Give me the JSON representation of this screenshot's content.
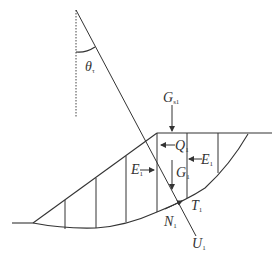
{
  "diagram": {
    "type": "slope-stability-slice-method",
    "colors": {
      "line": "#333333",
      "background": "#ffffff"
    },
    "angle_label": {
      "main": "θ",
      "sub": "τ"
    },
    "labels": {
      "G_s1": {
        "main": "G",
        "sub": "s1"
      },
      "Q1": {
        "main": "Q",
        "sub": "1"
      },
      "E1_right": {
        "main": "E",
        "sub": "1"
      },
      "E1_left": {
        "main": "E",
        "sub": "1"
      },
      "G1": {
        "main": "G",
        "sub": "1"
      },
      "T1": {
        "main": "T",
        "sub": "1"
      },
      "N1": {
        "main": "N",
        "sub": "1"
      },
      "U1": {
        "main": "U",
        "sub": "1"
      }
    },
    "slice_count": 7
  }
}
